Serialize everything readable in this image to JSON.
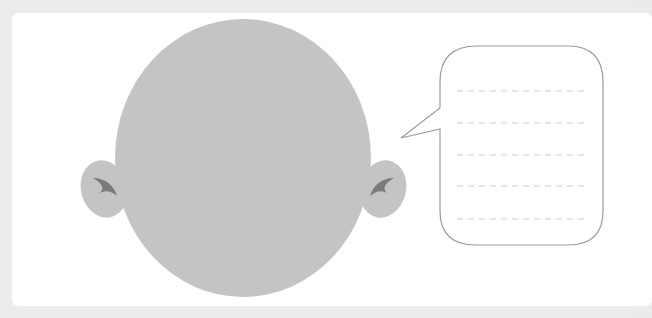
{
  "illustration": {
    "title": "Blank face with empty speech bubble",
    "colors": {
      "background": "#ebebeb",
      "card": "#ffffff",
      "head_fill": "#c4c4c4",
      "ear_detail": "#7a7a7a",
      "bubble_stroke": "#9a9a9a",
      "dash_lines": "#cfcfcf"
    },
    "speech_bubble": {
      "line_count": 5,
      "text_lines": [
        "",
        "",
        "",
        "",
        ""
      ]
    }
  }
}
